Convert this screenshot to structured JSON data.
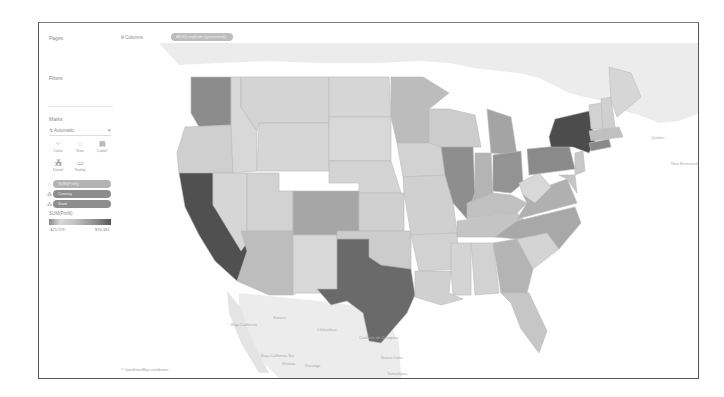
{
  "shelves": {
    "pages_label": "Pages",
    "filters_label": "Filters",
    "marks_label": "Marks",
    "columns": {
      "icon": "iii",
      "label": "Columns",
      "pill": "AVG(Longitude (generated))"
    },
    "rows": {
      "icon": "≡",
      "label": "Rows",
      "pill": "AVG(Latitude (generated))"
    }
  },
  "marks": {
    "type_icon": "↯",
    "type_label": "Automatic",
    "chevron": "▾",
    "buttons": [
      {
        "name": "color",
        "icon": "⁘",
        "label": "Color"
      },
      {
        "name": "size",
        "icon": "◌",
        "label": "Size"
      },
      {
        "name": "label",
        "icon": "▤",
        "label": "Label"
      },
      {
        "name": "detail",
        "icon": "⁂",
        "label": "Detail"
      },
      {
        "name": "tooltip",
        "icon": "▭",
        "label": "Tooltip"
      }
    ],
    "pills": [
      {
        "icon": "⁘",
        "label": "SUM(Profit)",
        "color": "#b3b3b3"
      },
      {
        "icon": "⁂",
        "label": "Country",
        "color": "#8d8d8d"
      },
      {
        "icon": "⁂",
        "label": "State",
        "color": "#8d8d8d"
      }
    ]
  },
  "legend": {
    "title": "SUM(Profit)",
    "min": "-$25,729",
    "max": "$76,381"
  },
  "map": {
    "attribution": "© OpenStreetMap contributors",
    "place_labels": [
      {
        "text": "Baja California",
        "x": 112,
        "y": 283
      },
      {
        "text": "Sonora",
        "x": 154,
        "y": 276
      },
      {
        "text": "Chihuahua",
        "x": 198,
        "y": 288
      },
      {
        "text": "Coahuila de Zaragoza",
        "x": 240,
        "y": 296
      },
      {
        "text": "Baja California Sur",
        "x": 142,
        "y": 314
      },
      {
        "text": "Sinaloa",
        "x": 163,
        "y": 322
      },
      {
        "text": "Durango",
        "x": 186,
        "y": 324
      },
      {
        "text": "Nuevo León",
        "x": 262,
        "y": 316
      },
      {
        "text": "Tamaulipas",
        "x": 268,
        "y": 332
      },
      {
        "text": "Quebec",
        "x": 532,
        "y": 96
      },
      {
        "text": "New Brunswick",
        "x": 552,
        "y": 122
      }
    ]
  },
  "colors": {
    "darkest": "#4a4a4a",
    "dark": "#6e6e6e",
    "mid_dark": "#8c8c8c",
    "mid": "#a8a8a8",
    "light": "#c4c4c4",
    "lighter": "#d2d2d2",
    "lightest": "#dcdcdc",
    "land_bg": "#ececec",
    "water": "#ffffff"
  }
}
